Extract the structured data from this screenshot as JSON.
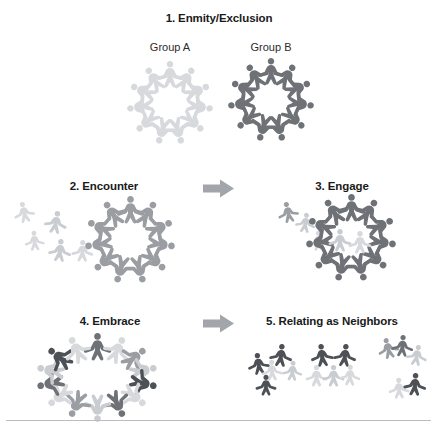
{
  "figure": {
    "background_color": "#ffffff",
    "colors": {
      "light_gray": "#d7d9dc",
      "light_gray_2": "#c9ccd0",
      "mid_gray": "#9a9da1",
      "dark_gray": "#6e7276",
      "darker_gray": "#4d5155",
      "arrow_gray": "#a2a5a9",
      "text_color": "#1a1a1a",
      "rule_color": "#b9bcc0"
    },
    "stages": [
      {
        "number": "1",
        "label": "1. Enmity/Exclusion",
        "group_labels": [
          "Group A",
          "Group B"
        ],
        "description": "Two separate rings of people, one light and one dark, standing apart"
      },
      {
        "number": "2",
        "label": "2. Encounter",
        "description": "Scattered light figures approach a dark ring of people"
      },
      {
        "number": "3",
        "label": "3. Engage",
        "description": "Light figures move inside the dark ring"
      },
      {
        "number": "4",
        "label": "4. Embrace",
        "description": "A single wide ring of intermixed light and dark figures"
      },
      {
        "number": "5",
        "label": "5. Relating as Neighbors",
        "description": "Three small mixed clusters of light and dark figures dispersed"
      }
    ],
    "arrows": [
      {
        "name": "arrow-2-to-3",
        "direction": "right"
      },
      {
        "name": "arrow-4-to-5",
        "direction": "right"
      }
    ],
    "caption_ghost": ""
  }
}
